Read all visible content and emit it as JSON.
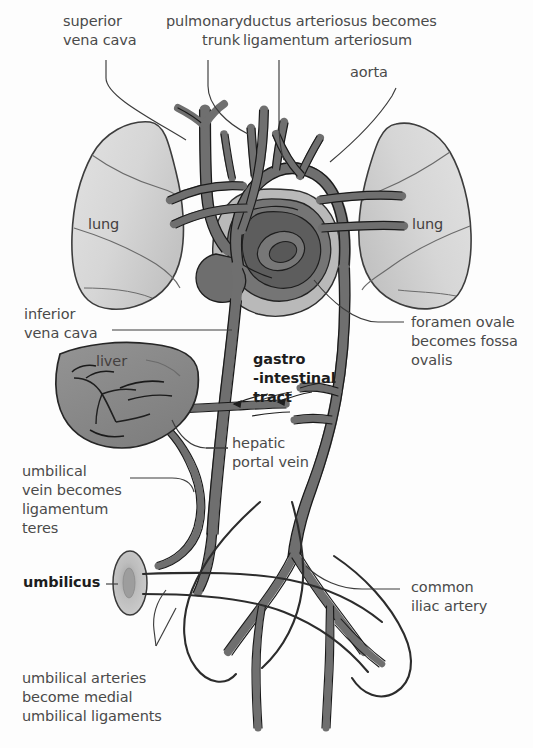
{
  "figure": {
    "background_color": "#fdfdfd"
  },
  "colors": {
    "vessel_fill": "#6f6f6f",
    "vessel_stroke": "#1a1a1a",
    "lung_fill": "#d4d4d4",
    "lung_stroke": "#3a3a3a",
    "liver_fill": "#8b8b8b",
    "liver_stroke": "#2a2a2a",
    "heart_outer_fill": "#b9b9b9",
    "heart_mid_fill": "#757575",
    "heart_inner_fill": "#5d5d5d",
    "umbilicus_fill": "#bfbfbf",
    "umbilicus_core": "#9a9a9a",
    "leader_line": "#3c3c3c",
    "label_text": "#4a4a4a",
    "label_bold_text": "#1d1d1d"
  },
  "labels": {
    "superior_vena_cava": "superior\nvena cava",
    "pulmonary_trunk": "pulmonary\ntrunk",
    "ductus_arteriosus": "ductus arteriosus becomes\nligamentum arteriosum",
    "aorta": "aorta",
    "lung_left": "lung",
    "lung_right": "lung",
    "inferior_vena_cava": "inferior\nvena cava",
    "liver": "liver",
    "gastrointestinal_tract": "gastro\n-intestinal\ntract",
    "foramen_ovale": "foramen ovale\nbecomes fossa\novalis",
    "hepatic_portal_vein": "hepatic\nportal vein",
    "umbilical_vein": "umbilical\nvein becomes\nligamentum\nteres",
    "umbilicus": "umbilicus",
    "common_iliac_artery": "common\niliac artery",
    "umbilical_arteries": "umbilical arteries\nbecome medial\numbilical ligaments"
  },
  "structures": [
    {
      "name": "left-lung",
      "type": "organ"
    },
    {
      "name": "right-lung",
      "type": "organ"
    },
    {
      "name": "heart",
      "type": "organ"
    },
    {
      "name": "liver",
      "type": "organ"
    },
    {
      "name": "umbilicus",
      "type": "landmark"
    },
    {
      "name": "aorta",
      "type": "vessel"
    },
    {
      "name": "superior-vena-cava",
      "type": "vessel"
    },
    {
      "name": "inferior-vena-cava",
      "type": "vessel"
    },
    {
      "name": "pulmonary-trunk",
      "type": "vessel"
    },
    {
      "name": "ductus-arteriosus",
      "type": "vessel"
    },
    {
      "name": "hepatic-portal-vein",
      "type": "vessel"
    },
    {
      "name": "umbilical-vein",
      "type": "vessel"
    },
    {
      "name": "umbilical-arteries",
      "type": "vessel"
    },
    {
      "name": "common-iliac-artery",
      "type": "vessel"
    }
  ]
}
